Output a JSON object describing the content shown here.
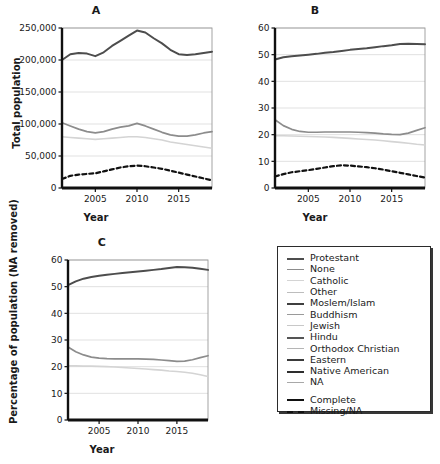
{
  "figure": {
    "panels": [
      {
        "id": "A",
        "title": "A",
        "xlabel": "Year",
        "ylabel": "Total population"
      },
      {
        "id": "B",
        "title": "B",
        "xlabel": "Year",
        "ylabel": "Percentage of population"
      },
      {
        "id": "C",
        "title": "C",
        "xlabel": "Year",
        "ylabel": "Percentage of population\n(NA removed)"
      }
    ]
  },
  "legend": {
    "series_entries": [
      {
        "label": "Protestant",
        "color": "#4d4d4d",
        "width": 2.0,
        "dash": "none"
      },
      {
        "label": "None",
        "color": "#8c8c8c",
        "width": 1.7,
        "dash": "none"
      },
      {
        "label": "Catholic",
        "color": "#d4d4d4",
        "width": 1.6,
        "dash": "none"
      },
      {
        "label": "Other",
        "color": "#bdbdbd",
        "width": 1.6,
        "dash": "none"
      },
      {
        "label": "Moslem/Islam",
        "color": "#3f3f3f",
        "width": 2.0,
        "dash": "none"
      },
      {
        "label": "Buddhism",
        "color": "#9a9a9a",
        "width": 1.7,
        "dash": "none"
      },
      {
        "label": "Jewish",
        "color": "#c8c8c8",
        "width": 1.6,
        "dash": "none"
      },
      {
        "label": "Hindu",
        "color": "#555555",
        "width": 2.0,
        "dash": "none"
      },
      {
        "label": "Orthodox Christian",
        "color": "#b5b5b5",
        "width": 1.6,
        "dash": "none"
      },
      {
        "label": "Eastern",
        "color": "#3a3a3a",
        "width": 2.0,
        "dash": "none"
      },
      {
        "label": "Native American",
        "color": "#2e2e2e",
        "width": 2.2,
        "dash": "none"
      },
      {
        "label": "NA",
        "color": "#a8a8a8",
        "width": 1.7,
        "dash": "none"
      }
    ],
    "style_entries": [
      {
        "label": "Complete",
        "color": "#111111",
        "width": 2.2,
        "dash": "none"
      },
      {
        "label": "Missing/NA",
        "color": "#111111",
        "width": 2.2,
        "dash": "dashed"
      }
    ]
  },
  "chart_data": [
    {
      "type": "line",
      "panel": "A",
      "title": "A",
      "xlabel": "Year",
      "ylabel": "Total population",
      "xlim": [
        2001,
        2019
      ],
      "ylim": [
        0,
        250000
      ],
      "xticks": [
        2005,
        2010,
        2015
      ],
      "yticks": [
        0,
        50000,
        100000,
        150000,
        200000,
        250000
      ],
      "ytick_labels": [
        "0",
        "50,000",
        "100,000",
        "150,000",
        "200,000",
        "250,000"
      ],
      "grid": true,
      "x": [
        2001,
        2002,
        2003,
        2004,
        2005,
        2006,
        2007,
        2008,
        2009,
        2010,
        2011,
        2012,
        2013,
        2014,
        2015,
        2016,
        2017,
        2018,
        2019
      ],
      "series": [
        {
          "name": "Protestant",
          "style": "Complete",
          "values": [
            200000,
            209000,
            211000,
            210000,
            206000,
            212000,
            222000,
            230000,
            238000,
            246000,
            243000,
            234000,
            226000,
            216000,
            209000,
            208000,
            209000,
            211000,
            213000
          ]
        },
        {
          "name": "None",
          "style": "Complete",
          "values": [
            102000,
            97000,
            92000,
            88000,
            86000,
            88000,
            92000,
            95000,
            97000,
            101000,
            97000,
            92000,
            87000,
            83000,
            81000,
            81000,
            83000,
            86000,
            88000
          ]
        },
        {
          "name": "Catholic",
          "style": "Complete",
          "values": [
            80000,
            79000,
            78000,
            77000,
            76000,
            77000,
            78000,
            79000,
            80000,
            80000,
            79000,
            77000,
            75000,
            72000,
            70000,
            68000,
            66000,
            64000,
            62000
          ]
        },
        {
          "name": "Missing/NA",
          "style": "Missing/NA",
          "values": [
            14000,
            19000,
            21000,
            22000,
            23000,
            26000,
            29000,
            32000,
            34000,
            35000,
            34000,
            32000,
            30000,
            27000,
            24000,
            21000,
            18000,
            15000,
            12000
          ]
        }
      ]
    },
    {
      "type": "line",
      "panel": "B",
      "title": "B",
      "xlabel": "Year",
      "ylabel": "Percentage of population",
      "xlim": [
        2001,
        2019
      ],
      "ylim": [
        0,
        60
      ],
      "xticks": [
        2005,
        2010,
        2015
      ],
      "yticks": [
        0,
        10,
        20,
        30,
        40,
        50,
        60
      ],
      "ytick_labels": [
        "0",
        "10",
        "20",
        "30",
        "40",
        "50",
        "60"
      ],
      "grid": true,
      "x": [
        2001,
        2002,
        2003,
        2004,
        2005,
        2006,
        2007,
        2008,
        2009,
        2010,
        2011,
        2012,
        2013,
        2014,
        2015,
        2016,
        2017,
        2018,
        2019
      ],
      "series": [
        {
          "name": "Protestant",
          "style": "Complete",
          "values": [
            48.2,
            49.0,
            49.4,
            49.7,
            50.0,
            50.3,
            50.7,
            51.0,
            51.4,
            51.8,
            52.1,
            52.4,
            52.8,
            53.2,
            53.5,
            54.0,
            54.1,
            54.0,
            53.9
          ]
        },
        {
          "name": "None",
          "style": "Complete",
          "values": [
            25.6,
            23.4,
            22.0,
            21.2,
            20.9,
            20.9,
            21.0,
            21.0,
            21.0,
            21.0,
            20.9,
            20.8,
            20.6,
            20.3,
            20.1,
            20.0,
            20.6,
            21.6,
            22.6
          ]
        },
        {
          "name": "Catholic",
          "style": "Complete",
          "values": [
            19.6,
            19.6,
            19.5,
            19.4,
            19.3,
            19.2,
            19.1,
            19.0,
            18.8,
            18.6,
            18.4,
            18.2,
            18.0,
            17.7,
            17.4,
            17.1,
            16.8,
            16.4,
            16.1
          ]
        },
        {
          "name": "Missing/NA",
          "style": "Missing/NA",
          "values": [
            4.3,
            5.2,
            5.9,
            6.3,
            6.7,
            7.2,
            7.7,
            8.2,
            8.5,
            8.4,
            8.1,
            7.8,
            7.4,
            6.9,
            6.3,
            5.7,
            5.1,
            4.5,
            3.9
          ]
        }
      ]
    },
    {
      "type": "line",
      "panel": "C",
      "title": "C",
      "xlabel": "Year",
      "ylabel": "Percentage of population (NA removed)",
      "xlim": [
        2001,
        2019
      ],
      "ylim": [
        0,
        60
      ],
      "xticks": [
        2005,
        2010,
        2015
      ],
      "yticks": [
        0,
        10,
        20,
        30,
        40,
        50,
        60
      ],
      "ytick_labels": [
        "0",
        "10",
        "20",
        "30",
        "40",
        "50",
        "60"
      ],
      "grid": true,
      "x": [
        2001,
        2002,
        2003,
        2004,
        2005,
        2006,
        2007,
        2008,
        2009,
        2010,
        2011,
        2012,
        2013,
        2014,
        2015,
        2016,
        2017,
        2018,
        2019
      ],
      "series": [
        {
          "name": "Protestant",
          "style": "Complete",
          "values": [
            50.6,
            52.0,
            53.0,
            53.6,
            54.1,
            54.5,
            54.8,
            55.1,
            55.4,
            55.7,
            56.0,
            56.3,
            56.6,
            57.0,
            57.4,
            57.3,
            57.1,
            56.7,
            56.3
          ]
        },
        {
          "name": "None",
          "style": "Complete",
          "values": [
            27.4,
            25.6,
            24.4,
            23.6,
            23.2,
            23.0,
            22.9,
            22.9,
            22.9,
            22.9,
            22.8,
            22.7,
            22.5,
            22.3,
            22.0,
            22.1,
            22.6,
            23.4,
            24.1
          ]
        },
        {
          "name": "Catholic",
          "style": "Complete",
          "values": [
            20.3,
            20.3,
            20.2,
            20.2,
            20.1,
            20.0,
            19.9,
            19.7,
            19.5,
            19.3,
            19.1,
            18.9,
            18.7,
            18.4,
            18.2,
            17.9,
            17.5,
            17.0,
            16.3
          ]
        }
      ]
    }
  ]
}
